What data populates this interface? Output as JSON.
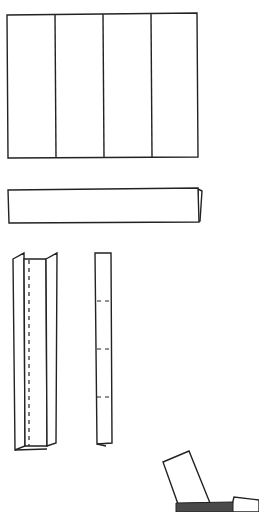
{
  "diagram": {
    "type": "origami-folding-steps",
    "colors": {
      "line": "#222222",
      "paper": "#ffffff",
      "shaded": "#4a4a4a"
    },
    "steps": [
      {
        "id": "step-1",
        "description": "Rectangle divided into four vertical panels",
        "panels": 4
      },
      {
        "id": "step-2",
        "description": "Folded horizontal strip with tucked right edge"
      },
      {
        "id": "step-3",
        "description": "Vertical strip with side flaps folded inward and dashed center fold line"
      },
      {
        "id": "step-4",
        "description": "Narrow vertical strip with three dashed fold marks",
        "fold_marks": 3
      },
      {
        "id": "step-5",
        "description": "Partially assembled piece with shaded base and raised flaps"
      }
    ]
  }
}
